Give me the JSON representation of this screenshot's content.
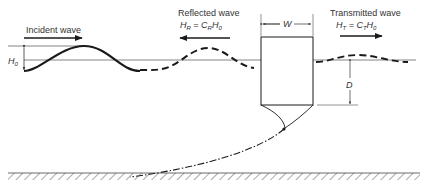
{
  "labels": {
    "incident": "Incident wave",
    "reflected": "Reflected wave",
    "reflected_formula": {
      "lhs": "H",
      "lhs_sub": "R",
      "eq": " = ",
      "c": "C",
      "c_sub": "R",
      "h": "H",
      "h_sub": "0"
    },
    "transmitted": "Transmitted wave",
    "transmitted_formula": {
      "lhs": "H",
      "lhs_sub": "T",
      "eq": " = ",
      "c": "C",
      "c_sub": "T",
      "h": "H",
      "h_sub": "0"
    },
    "h0": {
      "h": "H",
      "sub": "0"
    },
    "width": "W",
    "draft": "D"
  },
  "colors": {
    "ink": "#1a1a1a",
    "thin": "#555555",
    "background": "#ffffff"
  }
}
